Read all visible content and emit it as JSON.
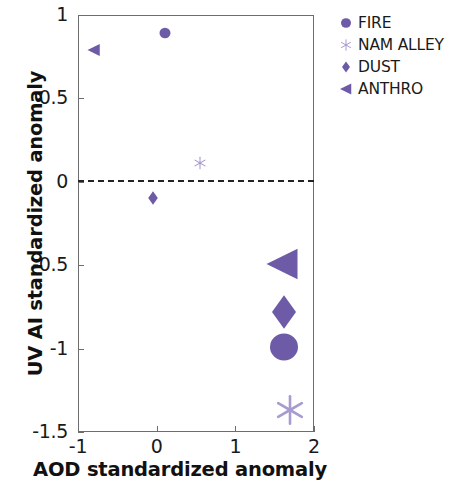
{
  "chart_data": {
    "type": "scatter",
    "title": "",
    "xlabel": "AOD standardized anomaly",
    "ylabel": "UV AI standardized anomaly",
    "xlim": [
      -1,
      2
    ],
    "ylim": [
      -1.5,
      1
    ],
    "xticks": [
      "-1",
      "0",
      "1",
      "2"
    ],
    "xtick_values": [
      -1,
      0,
      1,
      2
    ],
    "yticks": [
      "1",
      "0.5",
      "0",
      "-0.5",
      "-1",
      "-1.5"
    ],
    "ytick_values": [
      1,
      0.5,
      0,
      -0.5,
      -1,
      -1.5
    ],
    "grid": false,
    "legend_position": "upper-right-outside",
    "annotations": [
      {
        "name": "zero-reference-line",
        "type": "hline",
        "y": 0,
        "style": "dashed",
        "color": "#232323"
      }
    ],
    "accent_color": "#6E5BA8",
    "light_accent_color": "#A99BD0",
    "series": [
      {
        "name": "FIRE",
        "marker": "circle",
        "color": "#6E5BA8",
        "points": [
          {
            "x": 0.1,
            "y": 0.89,
            "size": 11
          },
          {
            "x": 1.62,
            "y": -0.99,
            "size": 28
          }
        ]
      },
      {
        "name": "NAM ALLEY",
        "marker": "star",
        "color": "#A99BD0",
        "points": [
          {
            "x": 0.55,
            "y": 0.11,
            "size": 11
          },
          {
            "x": 1.7,
            "y": -1.37,
            "size": 26
          }
        ]
      },
      {
        "name": "DUST",
        "marker": "diamond",
        "color": "#6E5BA8",
        "points": [
          {
            "x": -0.05,
            "y": -0.1,
            "size": 12
          },
          {
            "x": 1.62,
            "y": -0.78,
            "size": 30
          }
        ]
      },
      {
        "name": "ANTHRO",
        "marker": "triangle-left",
        "color": "#6E5BA8",
        "points": [
          {
            "x": -0.8,
            "y": 0.79,
            "size": 13
          },
          {
            "x": 1.6,
            "y": -0.49,
            "size": 33
          }
        ]
      }
    ]
  },
  "legend": {
    "items": [
      {
        "label": "FIRE",
        "marker": "circle",
        "color": "#6E5BA8"
      },
      {
        "label": "NAM ALLEY",
        "marker": "star",
        "color": "#A99BD0"
      },
      {
        "label": "DUST",
        "marker": "diamond",
        "color": "#6E5BA8"
      },
      {
        "label": "ANTHRO",
        "marker": "triangle-left",
        "color": "#6E5BA8"
      }
    ]
  }
}
